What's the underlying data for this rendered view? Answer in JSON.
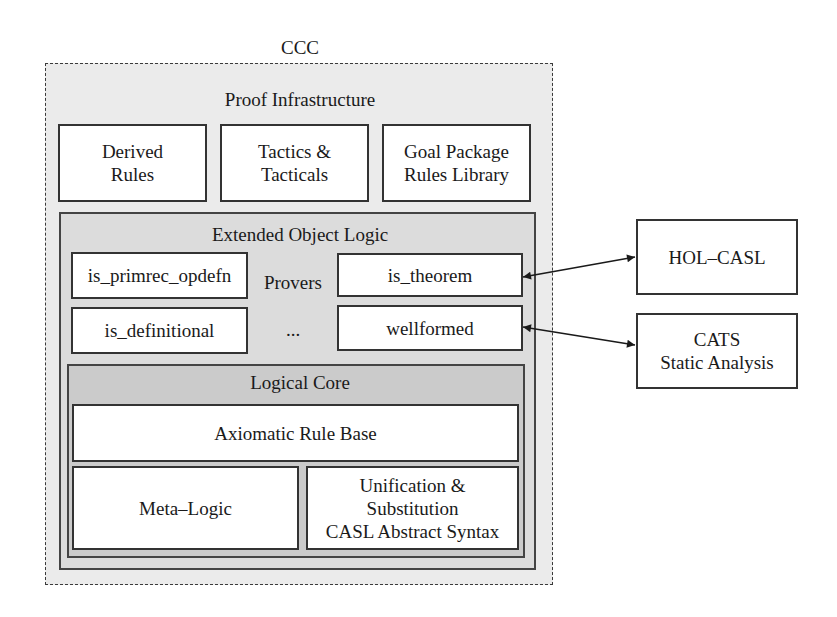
{
  "diagram": {
    "outer": {
      "title": "CCC"
    },
    "proof_infrastructure": {
      "title": "Proof Infrastructure",
      "boxes": [
        {
          "label": "Derived\nRules"
        },
        {
          "label": "Tactics &\nTacticals"
        },
        {
          "label": "Goal Package\nRules Library"
        }
      ]
    },
    "extended_object_logic": {
      "title": "Extended Object Logic",
      "provers_label": "Provers",
      "ellipsis": "...",
      "boxes": [
        {
          "label": "is_primrec_opdefn"
        },
        {
          "label": "is_theorem"
        },
        {
          "label": "is_definitional"
        },
        {
          "label": "wellformed"
        }
      ]
    },
    "logical_core": {
      "title": "Logical Core",
      "boxes": [
        {
          "label": "Axiomatic Rule Base"
        },
        {
          "label": "Meta–Logic"
        },
        {
          "label": "Unification &\nSubstitution\nCASL Abstract Syntax"
        }
      ]
    },
    "external": [
      {
        "label": "HOL–CASL",
        "connects_to": "is_theorem"
      },
      {
        "label": "CATS\nStatic Analysis",
        "connects_to": "wellformed"
      }
    ],
    "colors": {
      "outer_fill": "#ebebeb",
      "eol_fill": "#dcdcdc",
      "core_fill": "#cbcbcb",
      "box_fill": "#ffffff",
      "stroke": "#333333"
    }
  }
}
